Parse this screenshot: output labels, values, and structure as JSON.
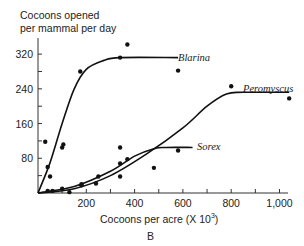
{
  "chart_data": {
    "type": "scatter",
    "title": "",
    "xlabel": "Cocoons per acre (X 10",
    "xlabel_sup": "3",
    "xlabel_close": ")",
    "ylabel_line1": "Cocoons opened",
    "ylabel_line2": "per mammal per day",
    "panel_label": "B",
    "xlim": [
      0,
      1050
    ],
    "ylim": [
      0,
      360
    ],
    "xticks": [
      200,
      400,
      600,
      800,
      1000
    ],
    "xtick_labels": [
      "200",
      "400",
      "600",
      "800",
      "1,000"
    ],
    "yticks": [
      80,
      160,
      240,
      320
    ],
    "ytick_labels": [
      "80",
      "160",
      "240",
      "320"
    ],
    "grid": false,
    "legend": "inline labels at curve ends",
    "series": [
      {
        "name": "Blarina",
        "points": [
          [
            30,
            118
          ],
          [
            40,
            60
          ],
          [
            50,
            38
          ],
          [
            100,
            105
          ],
          [
            105,
            112
          ],
          [
            175,
            280
          ],
          [
            340,
            312
          ],
          [
            370,
            342
          ],
          [
            580,
            282
          ]
        ],
        "curve": [
          [
            0,
            0
          ],
          [
            50,
            70
          ],
          [
            100,
            160
          ],
          [
            150,
            240
          ],
          [
            200,
            285
          ],
          [
            270,
            305
          ],
          [
            340,
            312
          ],
          [
            580,
            312
          ]
        ]
      },
      {
        "name": "Peromyscus",
        "points": [
          [
            40,
            5
          ],
          [
            60,
            5
          ],
          [
            100,
            10
          ],
          [
            180,
            20
          ],
          [
            250,
            38
          ],
          [
            340,
            68
          ],
          [
            370,
            78
          ],
          [
            480,
            58
          ],
          [
            800,
            246
          ],
          [
            1040,
            218
          ]
        ],
        "curve": [
          [
            0,
            0
          ],
          [
            150,
            10
          ],
          [
            300,
            40
          ],
          [
            450,
            90
          ],
          [
            600,
            150
          ],
          [
            700,
            200
          ],
          [
            780,
            228
          ],
          [
            850,
            232
          ],
          [
            1040,
            232
          ]
        ]
      },
      {
        "name": "Sorex",
        "points": [
          [
            130,
            2
          ],
          [
            180,
            18
          ],
          [
            240,
            22
          ],
          [
            340,
            38
          ],
          [
            340,
            105
          ],
          [
            580,
            98
          ]
        ],
        "curve": [
          [
            0,
            0
          ],
          [
            150,
            15
          ],
          [
            300,
            50
          ],
          [
            400,
            85
          ],
          [
            480,
            102
          ],
          [
            530,
            105
          ],
          [
            640,
            105
          ]
        ]
      }
    ]
  },
  "labels": {
    "blarina": "Blarina",
    "peromyscus": "Peromyscus",
    "sorex": "Sorex"
  }
}
